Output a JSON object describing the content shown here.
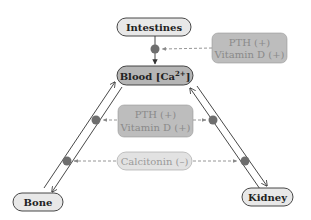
{
  "nodes": {
    "intestines": {
      "label": "Intestines"
    },
    "blood": {
      "label": "Blood [Ca",
      "sup": "2+",
      "close": "]"
    },
    "bone": {
      "label": "Bone"
    },
    "kidney": {
      "label": "Kidney"
    }
  },
  "regulators": {
    "top": {
      "line1": "PTH (+)",
      "line2": "Vitamin D (+)"
    },
    "middle": {
      "line1": "PTH (+)",
      "line2": "Vitamin D (+)"
    },
    "calcitonin": {
      "label": "Calcitonin (–)"
    }
  },
  "colors": {
    "light_node_fill": "#e8e8e8",
    "dark_node_fill": "#b5b5b5",
    "regulator_fill": "#bdbdbd",
    "regulator_text": "#8a8a8a",
    "calcitonin_fill": "#e2e2e2",
    "calcitonin_text": "#9a9a9a",
    "dot_fill": "#6e6e6e",
    "line": "#333333",
    "dashed": "#8a8a8a"
  }
}
